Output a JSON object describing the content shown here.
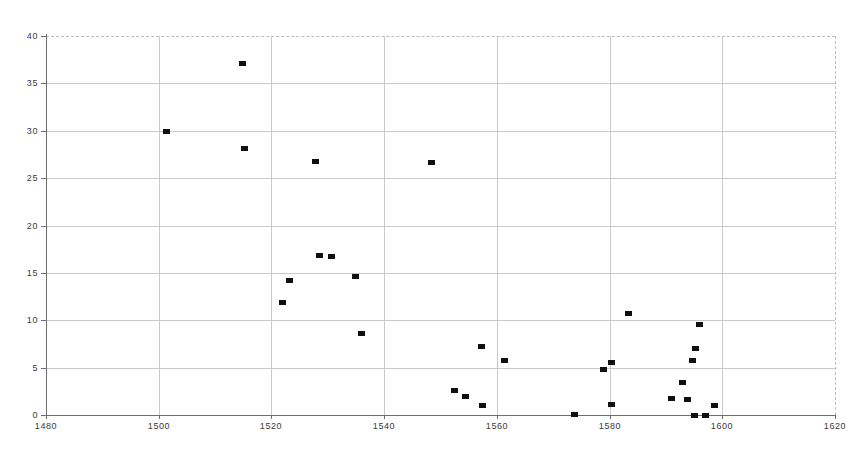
{
  "chart_data": {
    "type": "scatter",
    "title": "",
    "subtitle": "",
    "xlabel": "",
    "ylabel": "",
    "xlim": [
      1480,
      1620
    ],
    "ylim": [
      0,
      40
    ],
    "xticks": [
      1480,
      1500,
      1520,
      1540,
      1560,
      1580,
      1600,
      1620
    ],
    "yticks": [
      0,
      5,
      10,
      15,
      20,
      25,
      30,
      35,
      40
    ],
    "xtick_labels": [
      "1480",
      "1500",
      "1520",
      "1540",
      "1560",
      "1580",
      "1600",
      "1620"
    ],
    "ytick_labels": [
      "0",
      "5",
      "10",
      "15",
      "20",
      "25",
      "30",
      "35",
      "40"
    ],
    "grid": true,
    "legend": null,
    "marker": "square",
    "marker_color": "#101010",
    "grid_color": "#c9c9c9",
    "axis_color": "#6e6e6e",
    "background": "#ffffff",
    "series": [
      {
        "name": "series-1",
        "points": [
          {
            "x": 1501.3,
            "y": 29.9
          },
          {
            "x": 1514.8,
            "y": 37.1
          },
          {
            "x": 1515.2,
            "y": 28.1
          },
          {
            "x": 1521.9,
            "y": 11.9
          },
          {
            "x": 1523.2,
            "y": 14.2
          },
          {
            "x": 1527.8,
            "y": 26.8
          },
          {
            "x": 1528.6,
            "y": 16.8
          },
          {
            "x": 1530.7,
            "y": 16.7
          },
          {
            "x": 1535.0,
            "y": 14.6
          },
          {
            "x": 1535.9,
            "y": 8.6
          },
          {
            "x": 1548.4,
            "y": 26.7
          },
          {
            "x": 1552.4,
            "y": 2.6
          },
          {
            "x": 1554.5,
            "y": 1.9
          },
          {
            "x": 1557.3,
            "y": 7.2
          },
          {
            "x": 1557.4,
            "y": 1.0
          },
          {
            "x": 1561.4,
            "y": 5.7
          },
          {
            "x": 1573.8,
            "y": 0.1
          },
          {
            "x": 1579.0,
            "y": 4.8
          },
          {
            "x": 1580.3,
            "y": 5.5
          },
          {
            "x": 1580.3,
            "y": 1.1
          },
          {
            "x": 1583.3,
            "y": 10.7
          },
          {
            "x": 1591.0,
            "y": 1.7
          },
          {
            "x": 1593.0,
            "y": 3.4
          },
          {
            "x": 1593.9,
            "y": 1.6
          },
          {
            "x": 1594.8,
            "y": 5.7
          },
          {
            "x": 1595.0,
            "y": 0.0
          },
          {
            "x": 1595.2,
            "y": 7.0
          },
          {
            "x": 1595.9,
            "y": 9.5
          },
          {
            "x": 1597.1,
            "y": 0.0
          },
          {
            "x": 1598.6,
            "y": 1.0
          }
        ]
      }
    ]
  }
}
